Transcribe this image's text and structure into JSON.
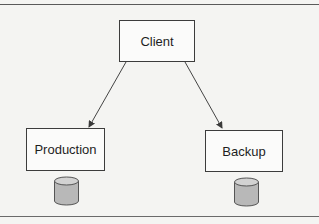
{
  "diagram": {
    "type": "client-server replication",
    "nodes": [
      {
        "id": "client",
        "label": "Client"
      },
      {
        "id": "production",
        "label": "Production"
      },
      {
        "id": "backup",
        "label": "Backup"
      }
    ],
    "edges": [
      {
        "from": "client",
        "to": "production",
        "arrow": "end"
      },
      {
        "from": "client",
        "to": "backup",
        "arrow": "end"
      }
    ],
    "databases": [
      {
        "attached_to": "production",
        "icon": "database-cylinder-icon"
      },
      {
        "attached_to": "backup",
        "icon": "database-cylinder-icon"
      }
    ],
    "colors": {
      "background": "#f4f4f2",
      "box_border": "#3c3c3c",
      "box_fill": "#fbfbfa",
      "cylinder_fill": "#b8b8b8",
      "cylinder_top": "#d2d2d2",
      "line": "#444444"
    }
  }
}
